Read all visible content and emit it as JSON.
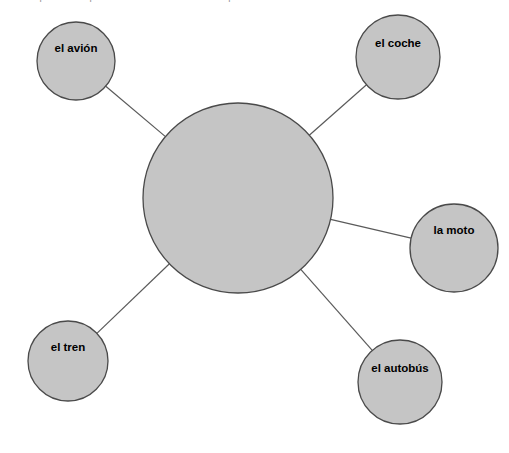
{
  "header": {
    "cut_off_text": "Completa el mapa con el vocabulario del transporte."
  },
  "diagram": {
    "type": "word-web",
    "colors": {
      "bubble_fill": "#c5c5c5",
      "bubble_stroke": "#4a4a4a",
      "connector": "#5a5a5a",
      "background": "#ffffff",
      "label_text": "#000000"
    },
    "center": {
      "label": "",
      "cx": 238,
      "cy": 198,
      "r": 95
    },
    "nodes": [
      {
        "id": "avion",
        "label": "el avión",
        "cx": 76,
        "cy": 61,
        "r": 39,
        "label_dx": 0,
        "label_dy": -13
      },
      {
        "id": "coche",
        "label": "el coche",
        "cx": 398,
        "cy": 57,
        "r": 42,
        "label_dx": 0,
        "label_dy": -14
      },
      {
        "id": "moto",
        "label": "la moto",
        "cx": 454,
        "cy": 248,
        "r": 44,
        "label_dx": 0,
        "label_dy": -18
      },
      {
        "id": "autobus",
        "label": "el autobús",
        "cx": 400,
        "cy": 382,
        "r": 42,
        "label_dx": 0,
        "label_dy": -14
      },
      {
        "id": "tren",
        "label": "el tren",
        "cx": 68,
        "cy": 361,
        "r": 40,
        "label_dx": 0,
        "label_dy": -14
      }
    ],
    "connectors": [
      {
        "from": "center",
        "to": "avion"
      },
      {
        "from": "center",
        "to": "coche"
      },
      {
        "from": "center",
        "to": "moto"
      },
      {
        "from": "center",
        "to": "autobus"
      },
      {
        "from": "center",
        "to": "tren"
      }
    ]
  }
}
